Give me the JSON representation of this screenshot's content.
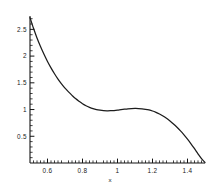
{
  "chart_data": {
    "type": "line",
    "title": "",
    "xlabel": "x",
    "ylabel": "",
    "xlim": [
      0.5,
      1.5
    ],
    "ylim": [
      0.0,
      2.75
    ],
    "grid": false,
    "legend": null,
    "x_ticks_major": [
      0.6,
      0.8,
      1.0,
      1.2,
      1.4
    ],
    "x_tick_labels": [
      "0.6",
      "0.8",
      "1",
      "1.2",
      "1.4"
    ],
    "x_ticks_minor": [
      0.52,
      0.54,
      0.56,
      0.58,
      0.62,
      0.64,
      0.66,
      0.68,
      0.72,
      0.74,
      0.76,
      0.78,
      0.82,
      0.84,
      0.86,
      0.88,
      0.92,
      0.94,
      0.96,
      0.98,
      1.02,
      1.04,
      1.06,
      1.08,
      1.12,
      1.14,
      1.16,
      1.18,
      1.22,
      1.24,
      1.26,
      1.28,
      1.32,
      1.34,
      1.36,
      1.38,
      1.42,
      1.44,
      1.46,
      1.48
    ],
    "y_ticks_major": [
      0.5,
      1.0,
      1.5,
      2.0,
      2.5
    ],
    "y_tick_labels": [
      "0.5",
      "1",
      "1.5",
      "2",
      "2.5"
    ],
    "y_ticks_minor": [
      0.1,
      0.2,
      0.3,
      0.4,
      0.6,
      0.7,
      0.8,
      0.9,
      1.1,
      1.2,
      1.3,
      1.4,
      1.6,
      1.7,
      1.8,
      1.9,
      2.1,
      2.2,
      2.3,
      2.4,
      2.6,
      2.7
    ],
    "series": [
      {
        "name": "curve",
        "color": "#1c1c1c",
        "x": [
          0.5,
          0.52,
          0.54,
          0.56,
          0.58,
          0.6,
          0.62,
          0.64,
          0.66,
          0.68,
          0.7,
          0.72,
          0.74,
          0.76,
          0.78,
          0.8,
          0.82,
          0.84,
          0.86,
          0.88,
          0.9,
          0.92,
          0.94,
          0.96,
          0.98,
          1.0,
          1.02,
          1.04,
          1.06,
          1.08,
          1.1,
          1.12,
          1.14,
          1.16,
          1.18,
          1.2,
          1.22,
          1.24,
          1.26,
          1.28,
          1.3,
          1.32,
          1.34,
          1.36,
          1.38,
          1.4,
          1.42,
          1.44,
          1.46,
          1.48,
          1.5
        ],
        "y": [
          2.72,
          2.52,
          2.34,
          2.18,
          2.035,
          1.9,
          1.78,
          1.67,
          1.57,
          1.48,
          1.4,
          1.33,
          1.265,
          1.205,
          1.155,
          1.11,
          1.072,
          1.042,
          1.018,
          1.0,
          0.988,
          0.98,
          0.977,
          0.978,
          0.982,
          0.989,
          0.998,
          1.006,
          1.013,
          1.018,
          1.02,
          1.019,
          1.014,
          1.005,
          0.992,
          0.973,
          0.948,
          0.917,
          0.88,
          0.836,
          0.786,
          0.73,
          0.668,
          0.6,
          0.526,
          0.446,
          0.36,
          0.268,
          0.172,
          0.082,
          0.01
        ]
      }
    ]
  },
  "axes_geometry": {
    "plot_left_px": 30,
    "plot_right_px": 205,
    "plot_top_px": 16,
    "plot_bottom_px": 163
  }
}
